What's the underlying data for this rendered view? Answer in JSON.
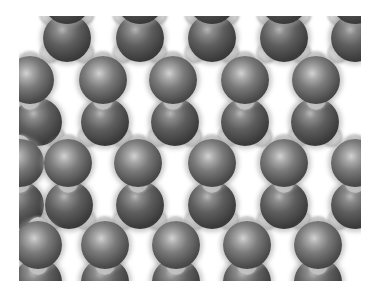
{
  "image": {
    "subject": "space-filling molecular lattice model",
    "background": "#ffffff",
    "frame": {
      "x": 19,
      "y": 16,
      "width": 342,
      "height": 265
    },
    "colors": {
      "large_atom_dark": "#3c3c3c",
      "large_atom_highlight": "#b8b8b8",
      "small_atom": "#d6d6d6",
      "halo": "#a0a0a0"
    },
    "atom_radius": 24,
    "small_atom_radius": 10,
    "rows": [
      {
        "y": 38,
        "type": "lobes-down",
        "x": [
          67,
          140,
          212,
          284,
          355
        ]
      },
      {
        "y": 80,
        "type": "lit",
        "x": [
          30,
          103,
          173,
          245,
          316
        ]
      },
      {
        "y": 122,
        "type": "lobes-down",
        "x": [
          38,
          105,
          175,
          245,
          315
        ]
      },
      {
        "y": 163,
        "type": "lit",
        "x": [
          20,
          68,
          138,
          212,
          284,
          355
        ]
      },
      {
        "y": 205,
        "type": "lobes-down",
        "x": [
          20,
          69,
          140,
          212,
          284,
          355
        ]
      },
      {
        "y": 245,
        "type": "lit",
        "x": [
          38,
          105,
          176,
          247,
          318
        ]
      },
      {
        "y": 282,
        "type": "lobes-down",
        "x": [
          38,
          105,
          176,
          247,
          318
        ]
      },
      {
        "y": 0,
        "type": "lobes-down",
        "x": [
          67,
          140,
          212,
          284,
          355
        ]
      }
    ]
  }
}
